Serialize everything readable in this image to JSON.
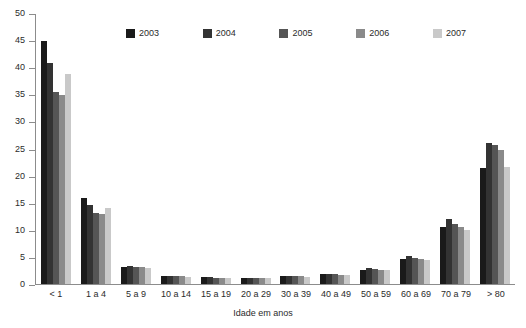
{
  "chart_data": {
    "type": "bar",
    "title": "",
    "xlabel": "Idade em anos",
    "ylabel": "",
    "ylim": [
      0,
      50
    ],
    "ytick_step": 5,
    "yticks": [
      50,
      45,
      40,
      35,
      30,
      25,
      20,
      15,
      10,
      5,
      0
    ],
    "grid": false,
    "legend_position": "top-center",
    "categories": [
      "< 1",
      "1 a 4",
      "5 a 9",
      "10 a 14",
      "15 a 19",
      "20 a 29",
      "30 a 39",
      "40 a 49",
      "50 a 59",
      "60 a 69",
      "70 a 79",
      "> 80"
    ],
    "series": [
      {
        "name": "2003",
        "color": "#1a1a1a",
        "values": [
          44.9,
          15.8,
          3.2,
          1.5,
          1.3,
          1.2,
          1.4,
          1.8,
          2.6,
          4.6,
          10.5,
          21.4
        ]
      },
      {
        "name": "2004",
        "color": "#333333",
        "values": [
          40.8,
          14.6,
          3.3,
          1.5,
          1.3,
          1.2,
          1.5,
          1.9,
          2.9,
          5.2,
          12.0,
          26.0
        ]
      },
      {
        "name": "2005",
        "color": "#555555",
        "values": [
          35.5,
          13.1,
          3.2,
          1.4,
          1.2,
          1.2,
          1.4,
          1.8,
          2.7,
          4.8,
          11.1,
          25.6
        ]
      },
      {
        "name": "2006",
        "color": "#8a8a8a",
        "values": [
          34.9,
          13.0,
          3.1,
          1.4,
          1.2,
          1.1,
          1.4,
          1.7,
          2.6,
          4.6,
          10.6,
          24.8
        ]
      },
      {
        "name": "2007",
        "color": "#c9c9c9",
        "values": [
          38.7,
          14.0,
          3.0,
          1.3,
          1.1,
          1.1,
          1.3,
          1.7,
          2.5,
          4.4,
          10.0,
          21.6
        ]
      }
    ]
  }
}
